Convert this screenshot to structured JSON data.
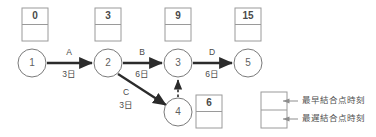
{
  "diagram": {
    "nodes": [
      {
        "id": "n1",
        "label": "1",
        "cx": 32,
        "cy": 63,
        "r": 14
      },
      {
        "id": "n2",
        "label": "2",
        "cx": 108,
        "cy": 63,
        "r": 14
      },
      {
        "id": "n3",
        "label": "3",
        "cx": 178,
        "cy": 63,
        "r": 14
      },
      {
        "id": "n4",
        "label": "4",
        "cx": 178,
        "cy": 112,
        "r": 14
      },
      {
        "id": "n5",
        "label": "5",
        "cx": 248,
        "cy": 63,
        "r": 14
      }
    ],
    "time_boxes": [
      {
        "for_node": "1",
        "earliest": "0",
        "latest": "",
        "x": 22,
        "y": 8,
        "w": 26,
        "h": 33
      },
      {
        "for_node": "2",
        "earliest": "3",
        "latest": "",
        "x": 95,
        "y": 8,
        "w": 26,
        "h": 33
      },
      {
        "for_node": "3",
        "earliest": "9",
        "latest": "",
        "x": 165,
        "y": 8,
        "w": 26,
        "h": 33
      },
      {
        "for_node": "5",
        "earliest": "15",
        "latest": "",
        "x": 235,
        "y": 8,
        "w": 26,
        "h": 33
      },
      {
        "for_node": "4",
        "earliest": "6",
        "latest": "",
        "x": 196,
        "y": 95,
        "w": 26,
        "h": 33
      }
    ],
    "activities": [
      {
        "id": "A",
        "name": "A",
        "duration": "3日",
        "from": "1",
        "to": "2",
        "x1": 47,
        "y1": 63,
        "x2": 92,
        "y2": 63,
        "name_x": 69,
        "name_y": 53,
        "dur_x": 69,
        "dur_y": 75,
        "dummy": false
      },
      {
        "id": "B",
        "name": "B",
        "duration": "6日",
        "from": "2",
        "to": "3",
        "x1": 123,
        "y1": 63,
        "x2": 162,
        "y2": 63,
        "name_x": 142,
        "name_y": 53,
        "dur_x": 142,
        "dur_y": 75,
        "dummy": false
      },
      {
        "id": "C",
        "name": "C",
        "duration": "3日",
        "from": "2",
        "to": "4",
        "x1": 118,
        "y1": 74,
        "x2": 166,
        "y2": 105,
        "name_x": 126,
        "name_y": 93,
        "dur_x": 126,
        "dur_y": 106,
        "dummy": false
      },
      {
        "id": "D",
        "name": "D",
        "duration": "6日",
        "from": "3",
        "to": "5",
        "x1": 193,
        "y1": 63,
        "x2": 232,
        "y2": 63,
        "name_x": 212,
        "name_y": 53,
        "dur_x": 212,
        "dur_y": 75,
        "dummy": false
      },
      {
        "id": "dummy",
        "name": "",
        "duration": "",
        "from": "4",
        "to": "3",
        "x1": 178,
        "y1": 97,
        "x2": 178,
        "y2": 80,
        "name_x": 0,
        "name_y": 0,
        "dur_x": 0,
        "dur_y": 0,
        "dummy": true
      }
    ],
    "legend": {
      "box": {
        "x": 261,
        "y": 92,
        "w": 26,
        "h": 36
      },
      "entries": [
        {
          "key": "earliest",
          "label": "最早結合点時刻",
          "cell_cy": 101,
          "text_x": 302,
          "text_y": 101
        },
        {
          "key": "latest",
          "label": "最遅結合点時刻",
          "cell_cy": 119,
          "text_x": 302,
          "text_y": 119
        }
      ]
    },
    "colors": {
      "background": "#ffffff",
      "node_stroke": "#7a7a7a",
      "box_stroke": "#9a9a9a",
      "arrow": "#2b2b2b",
      "text": "#4a4a4a",
      "legend_text": "#4f4f4f"
    }
  }
}
